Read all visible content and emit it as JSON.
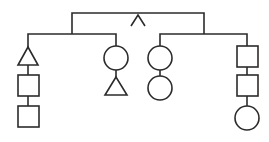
{
  "diagram": {
    "type": "tree",
    "stroke_color": "#2b2b2b",
    "background": "#ffffff",
    "root": {
      "symbol": "caret",
      "children": [
        {
          "name": "left-group",
          "children": [
            {
              "name": "column-1",
              "shapes": [
                "triangle",
                "square",
                "square"
              ]
            },
            {
              "name": "column-2",
              "shapes": [
                "circle",
                "triangle"
              ]
            }
          ]
        },
        {
          "name": "right-group",
          "children": [
            {
              "name": "column-3",
              "shapes": [
                "circle",
                "circle"
              ]
            },
            {
              "name": "column-4",
              "shapes": [
                "square",
                "square",
                "circle"
              ]
            }
          ]
        }
      ]
    }
  }
}
